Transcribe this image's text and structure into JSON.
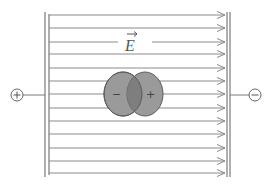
{
  "diagram": {
    "field_label": "E",
    "field_vector_arrow": "→",
    "left_terminal": {
      "symbol": "+",
      "name": "positive-terminal"
    },
    "right_terminal": {
      "symbol": "−",
      "name": "negative-terminal"
    },
    "dipole": {
      "left_charge": "−",
      "right_charge": "+"
    },
    "field_line_count": 13,
    "field_line_y": [
      15,
      28,
      42,
      54,
      68,
      81,
      94,
      108,
      121,
      134,
      148,
      161,
      173
    ],
    "colors": {
      "line": "#8a8a8a",
      "plate": "#7a7a7a",
      "dipole_fill": "#9a9a9a",
      "dipole_overlap": "#7e7e7e",
      "dipole_stroke": "#5a5a5a",
      "background": "#ffffff"
    }
  }
}
